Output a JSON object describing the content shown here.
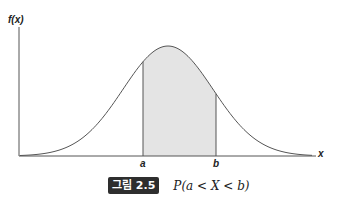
{
  "figure": {
    "ylabel": "f(x)",
    "xlabel": "x",
    "ticks": [
      {
        "label": "a",
        "x": 143
      },
      {
        "label": "b",
        "x": 216
      }
    ],
    "shade_color": "#e4e4e4",
    "line_color": "#555555"
  },
  "caption": {
    "badge": "그림 2.5",
    "text": "P(a < X < b)"
  },
  "chart_data": {
    "type": "area",
    "title": "P(a < X < b)",
    "xlabel": "x",
    "ylabel": "f(x)",
    "shaded_region": {
      "from": "a",
      "to": "b"
    },
    "tick_labels": [
      "a",
      "b"
    ],
    "grid": false,
    "legend": null
  }
}
